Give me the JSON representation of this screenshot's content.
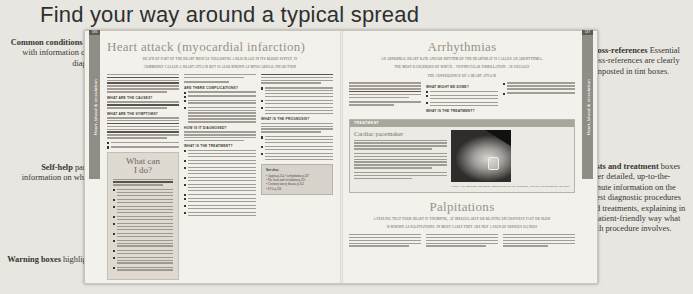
{
  "page_title": "Find your way around a typical spread",
  "annotations": {
    "left": [
      {
        "id": "common-conditions",
        "bold": "Common conditions",
        "rest": " are explained in full, with information on causes, symptoms, diagnosis and treatment."
      },
      {
        "id": "self-help",
        "bold": "Self-help",
        "rest": " panels include essential information on what you can do to help yourself."
      },
      {
        "id": "warning-boxes",
        "bold": "Warning boxes",
        "rest": " highlight important advice."
      }
    ],
    "right": [
      {
        "id": "cross-references",
        "bold": "Cross-references",
        "rest": " Essential cross-references are clearly signposted in tint boxes."
      },
      {
        "id": "tests-treatment",
        "bold": "Tests and treatment",
        "rest": " boxes offer detailed, up-to-the-minute information on the latest diagnostic procedures and treatments, explaining in a patient-friendly way what each procedure involves."
      }
    ]
  },
  "spread": {
    "left_page": {
      "folio": "186",
      "thumb_tab": "Heart, blood & circulation",
      "article_title": "Heart attack (myocardial infarction)",
      "standfirst_line1": "DEATH OF PART OF THE HEART MUSCLE FOLLOWING A BLOCKAGE IN ITS BLOOD SUPPLY, IS",
      "standfirst_line2": "COMMONLY CALLED A HEART ATTACK BUT IS ALSO KNOWN AS MYOCARDIAL INFARCTION",
      "subheads": [
        "ARE THERE COMPLICATIONS?",
        "WHAT ARE THE CAUSES?",
        "WHAT ARE THE SYMPTOMS?",
        "HOW IS IT DIAGNOSED?",
        "WHAT IS THE TREATMENT?",
        "WHAT IS THE PROGNOSIS?"
      ],
      "self_help_panel": {
        "title_line1": "What can",
        "title_line2": "I do?"
      },
      "tint_box": {
        "heading": "See also:",
        "rows": [
          "• Angina p.354   • Arrhythmias p.367",
          "• The heart and circulation p.335",
          "• Coronary artery disease p.353",
          "• ECG p.336"
        ]
      }
    },
    "right_page": {
      "folio": "187",
      "thumb_tab": "Heart, blood & circulation",
      "article_title_top": "Arrhythmias",
      "standfirst_top_line1": "AN ABNORMAL HEART RATE AND/OR RHYTHM OF THE HEARTBEAT IS CALLED AN ARRHYTHMIA.",
      "standfirst_top_line2": "THE MOST DANGEROUS OF WHICH – VENTRICULAR FIBRILLATION – IS USUALLY",
      "standfirst_top_line3": "THE CONSEQUENCE OF A HEART ATTACK",
      "subheads_top": [
        "WHAT MIGHT BE DONE?",
        "WHAT IS THE TREATMENT?"
      ],
      "treatment_box": {
        "kicker": "TREATMENT",
        "title": "Cardiac pacemaker",
        "caption": "Chest X-ray showing a pacemaker implanted below the collarbone, with its lead passing into the heart."
      },
      "article_title_bottom": "Palpitations",
      "standfirst_bottom_line1": "A FEELING THAT YOUR HEART IS THUMPING, AT IRREGULARLY OR BEATING EXCESSIVELY FAST OR SLOW",
      "standfirst_bottom_line2": "IS KNOWN AS PALPITATIONS. IN MOST CASES THEY ARE NOT A SIGN OF SERIOUS ILLNESS",
      "subheads_bottom": [
        "WHAT IS THE TREATMENT?"
      ]
    }
  },
  "colors": {
    "background": "#e8e6e1",
    "paper": "#f3f1ec",
    "heading": "#9b9186",
    "tab": "#8f8d86",
    "tint_box": "#d7d3ca",
    "treatment_header": "#aba69c"
  }
}
